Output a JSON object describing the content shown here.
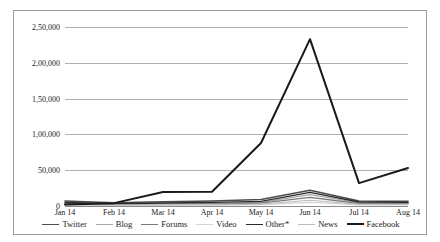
{
  "chart_data": {
    "type": "line",
    "title": "",
    "xlabel": "",
    "ylabel": "",
    "categories": [
      "Jan 14",
      "Feb 14",
      "Mar 14",
      "Apr 14",
      "May 14",
      "Jun 14",
      "Jul 14",
      "Aug 14"
    ],
    "ylim": [
      0,
      250000
    ],
    "yticks": [
      0,
      50000,
      100000,
      150000,
      200000,
      250000
    ],
    "ytick_labels": [
      "0",
      "50,000",
      "1,00,000",
      "1,50,000",
      "2,00,000",
      "2,50,000"
    ],
    "grid": true,
    "legend_position": "bottom",
    "series": [
      {
        "name": "Twitter",
        "color": "#4d4d4d",
        "width": 1.6,
        "values": [
          7000,
          4500,
          6000,
          7000,
          9000,
          22000,
          7000,
          6500
        ]
      },
      {
        "name": "Blog",
        "color": "#a6a6a6",
        "width": 1.2,
        "values": [
          3500,
          2500,
          3000,
          3500,
          5000,
          16000,
          4500,
          4000
        ]
      },
      {
        "name": "Forums",
        "color": "#7a7a7a",
        "width": 1.3,
        "values": [
          2500,
          2000,
          2500,
          3000,
          4000,
          12000,
          3500,
          3200
        ]
      },
      {
        "name": "Video",
        "color": "#d4d4d4",
        "width": 1.2,
        "values": [
          1200,
          900,
          1100,
          1300,
          1800,
          5000,
          1600,
          1500
        ]
      },
      {
        "name": "Other*",
        "color": "#2b2b2b",
        "width": 1.4,
        "values": [
          5000,
          3200,
          4200,
          5000,
          6500,
          19000,
          5500,
          5000
        ]
      },
      {
        "name": "News",
        "color": "#bdbdbd",
        "width": 1.2,
        "values": [
          1800,
          1400,
          1700,
          2000,
          2600,
          8000,
          2400,
          2200
        ]
      },
      {
        "name": "Facebook",
        "color": "#1a1a1a",
        "width": 2.0,
        "values": [
          2000,
          4000,
          19500,
          20000,
          88000,
          233000,
          32000,
          53000
        ]
      }
    ]
  }
}
